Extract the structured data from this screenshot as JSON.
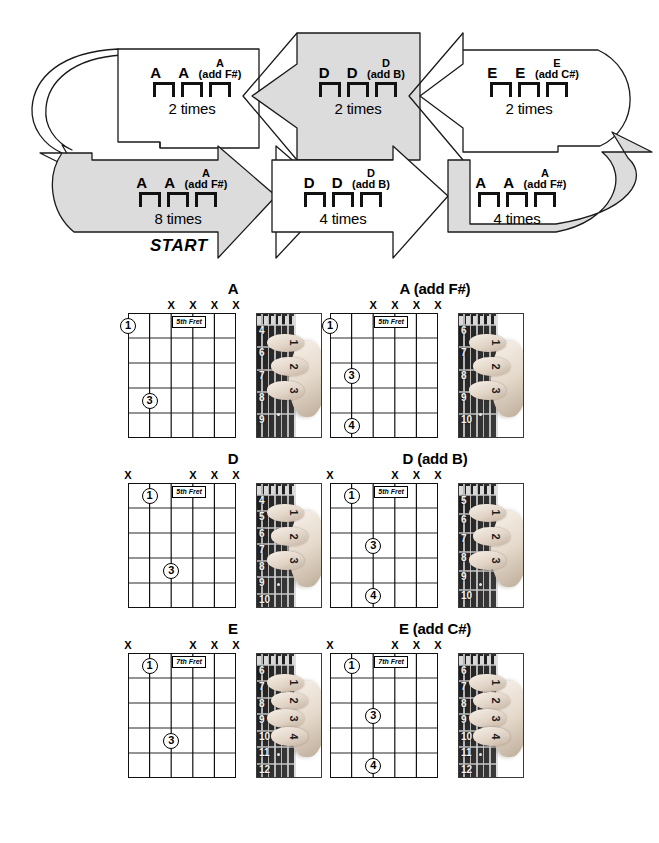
{
  "flow": {
    "start_label": "START",
    "blocks": [
      {
        "id": "row1-a",
        "chords": [
          "A",
          "A"
        ],
        "add_root": "A",
        "add_text": "(add F#)",
        "times": "2 times",
        "shaded": false
      },
      {
        "id": "row1-d",
        "chords": [
          "D",
          "D"
        ],
        "add_root": "D",
        "add_text": "(add B)",
        "times": "2 times",
        "shaded": true
      },
      {
        "id": "row1-e",
        "chords": [
          "E",
          "E"
        ],
        "add_root": "E",
        "add_text": "(add C#)",
        "times": "2 times",
        "shaded": false
      },
      {
        "id": "row2-a8",
        "chords": [
          "A",
          "A"
        ],
        "add_root": "A",
        "add_text": "(add F#)",
        "times": "8 times",
        "shaded": true
      },
      {
        "id": "row2-d4",
        "chords": [
          "D",
          "D"
        ],
        "add_root": "D",
        "add_text": "(add B)",
        "times": "4 times",
        "shaded": false
      },
      {
        "id": "row2-a4",
        "chords": [
          "A",
          "A"
        ],
        "add_root": "A",
        "add_text": "(add F#)",
        "times": "4 times",
        "shaded": true
      }
    ]
  },
  "chords": [
    {
      "id": "chord-a",
      "title": "A",
      "fret_label": "5th Fret",
      "x_strings": [
        3,
        4,
        5,
        6
      ],
      "dots": [
        {
          "string": 1,
          "fret": 1,
          "finger": "1"
        },
        {
          "string": 2,
          "fret": 4,
          "finger": "3"
        }
      ],
      "photo": {
        "start_fret": 4,
        "fret_numbers": [
          "4",
          "6",
          "7",
          "8",
          "9"
        ],
        "finger_numbers": [
          "1",
          "2",
          "3"
        ]
      }
    },
    {
      "id": "chord-a-add-fs",
      "title": "A (add F#)",
      "fret_label": "5th Fret",
      "x_strings": [
        3,
        4,
        5,
        6
      ],
      "dots": [
        {
          "string": 1,
          "fret": 1,
          "finger": "1"
        },
        {
          "string": 2,
          "fret": 3,
          "finger": "3"
        },
        {
          "string": 2,
          "fret": 5,
          "finger": "4"
        }
      ],
      "photo": {
        "start_fret": 6,
        "fret_numbers": [
          "6",
          "7",
          "8",
          "9",
          "10"
        ],
        "finger_numbers": [
          "1",
          "2",
          "3"
        ]
      }
    },
    {
      "id": "chord-d",
      "title": "D",
      "fret_label": "5th Fret",
      "x_strings": [
        1,
        4,
        5,
        6
      ],
      "dots": [
        {
          "string": 2,
          "fret": 1,
          "finger": "1"
        },
        {
          "string": 3,
          "fret": 4,
          "finger": "3"
        }
      ],
      "photo": {
        "start_fret": 4,
        "fret_numbers": [
          "4",
          "5",
          "6",
          "7",
          "8",
          "9",
          "10"
        ],
        "finger_numbers": [
          "1",
          "2",
          "3"
        ]
      }
    },
    {
      "id": "chord-d-add-b",
      "title": "D (add B)",
      "fret_label": "5th Fret",
      "x_strings": [
        1,
        4,
        5,
        6
      ],
      "dots": [
        {
          "string": 2,
          "fret": 1,
          "finger": "1"
        },
        {
          "string": 3,
          "fret": 3,
          "finger": "3"
        },
        {
          "string": 3,
          "fret": 5,
          "finger": "4"
        }
      ],
      "photo": {
        "start_fret": 5,
        "fret_numbers": [
          "5",
          "6",
          "7",
          "8",
          "9",
          "10"
        ],
        "finger_numbers": [
          "1",
          "2",
          "3"
        ]
      }
    },
    {
      "id": "chord-e",
      "title": "E",
      "fret_label": "7th Fret",
      "x_strings": [
        1,
        4,
        5,
        6
      ],
      "dots": [
        {
          "string": 2,
          "fret": 1,
          "finger": "1"
        },
        {
          "string": 3,
          "fret": 4,
          "finger": "3"
        }
      ],
      "photo": {
        "start_fret": 6,
        "fret_numbers": [
          "6",
          "7",
          "8",
          "9",
          "10",
          "11",
          "12"
        ],
        "finger_numbers": [
          "1",
          "2",
          "3",
          "4"
        ]
      }
    },
    {
      "id": "chord-e-add-cs",
      "title": "E (add C#)",
      "fret_label": "7th Fret",
      "x_strings": [
        1,
        4,
        5,
        6
      ],
      "dots": [
        {
          "string": 2,
          "fret": 1,
          "finger": "1"
        },
        {
          "string": 3,
          "fret": 3,
          "finger": "3"
        },
        {
          "string": 3,
          "fret": 5,
          "finger": "4"
        }
      ],
      "photo": {
        "start_fret": 6,
        "fret_numbers": [
          "6",
          "7",
          "8",
          "9",
          "10",
          "11",
          "12"
        ],
        "finger_numbers": [
          "1",
          "2",
          "3",
          "4"
        ]
      }
    }
  ],
  "colors": {
    "ink": "#000000",
    "shade": "#dcdcdc",
    "paper": "#ffffff"
  }
}
